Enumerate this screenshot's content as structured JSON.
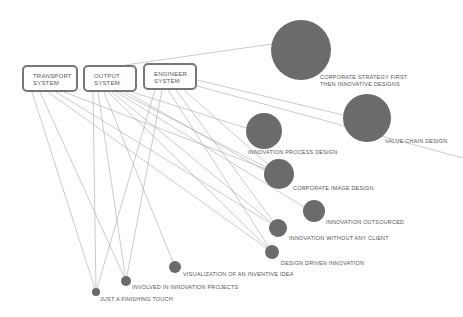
{
  "systems": [
    {
      "id": "transport",
      "line1": "TRANSPORT",
      "line2": "SYSTEM"
    },
    {
      "id": "output",
      "line1": "OUTPUT",
      "line2": "SYSTEM"
    },
    {
      "id": "engineer",
      "line1": "ENGINEER",
      "line2": "SYSTEM"
    }
  ],
  "nodes": [
    {
      "id": "corporate-strategy",
      "line1": "CORPORATE STRATEGY FIRST",
      "line2": "THEN INNOVATIVE DESIGNS"
    },
    {
      "id": "value-chain",
      "label": "VALUE CHAIN DESIGN"
    },
    {
      "id": "innovation-process",
      "label": "INNOVATION PROCESS DESIGN"
    },
    {
      "id": "corporate-image",
      "label": "CORPORATE IMAGE DESIGN"
    },
    {
      "id": "innovation-outsourced",
      "label": "INNOVATION OUTSOURCED"
    },
    {
      "id": "innovation-without-client",
      "label": "INNOVATION WITHOUT ANY CLIENT"
    },
    {
      "id": "design-driven",
      "label": "DESIGN DRIVEN INNOVATION"
    },
    {
      "id": "visualization",
      "label": "VISUALIZATION OF AN INVENTIVE IDEA"
    },
    {
      "id": "involved",
      "label": "INVOLVED IN INNOVATION PROJECTS"
    },
    {
      "id": "finishing-touch",
      "label": "JUST A FINISHING TOUCH"
    }
  ],
  "colors": {
    "node_fill": "#6b6b6b",
    "line": "#a8a8a8",
    "box_border": "#777777",
    "text": "#555555"
  }
}
